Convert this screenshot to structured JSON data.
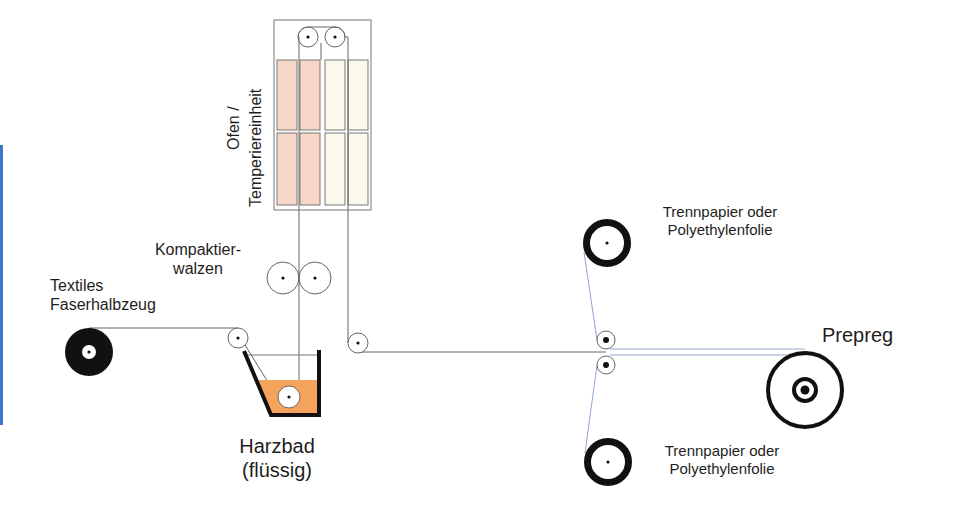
{
  "labels": {
    "oven_line1": "Ofen /",
    "oven_line2": "Temperiereinheit",
    "compaction_line1": "Kompaktier-",
    "compaction_line2": "walzen",
    "fiber_line1": "Textiles",
    "fiber_line2": "Faserhalbzeug",
    "bath_line1": "Harzbad",
    "bath_line2": "(flüssig)",
    "release_top_line1": "Trennpapier oder",
    "release_top_line2": "Polyethylenfolie",
    "release_bottom_line1": "Trennpapier oder",
    "release_bottom_line2": "Polyethylenfolie",
    "product": "Prepreg"
  },
  "colors": {
    "resin": "#f5a35c",
    "oven_hot": "#f7d8c8",
    "oven_cool": "#fbf8ec",
    "line": "#555555",
    "release_film": "#8fa6d0",
    "side_bar": "#3d77c4",
    "roll": "#111111"
  }
}
